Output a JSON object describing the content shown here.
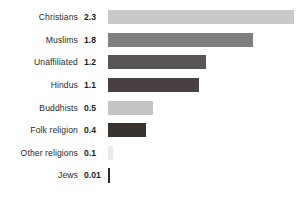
{
  "chart_data": {
    "type": "bar",
    "orientation": "horizontal",
    "title": "",
    "subtitle": "",
    "xlabel": "",
    "ylabel": "",
    "grid": false,
    "legend": "none",
    "axis_visible": false,
    "tick_labels": [],
    "xlim": [
      0,
      2.3
    ],
    "value_unit": "billions",
    "categories": [
      "Christians",
      "Muslims",
      "Unaffiliated",
      "Hindus",
      "Buddhists",
      "Folk religion",
      "Other religions",
      "Jews"
    ],
    "values": [
      2.3,
      1.8,
      1.2,
      1.1,
      0.5,
      0.4,
      0.1,
      0.01
    ],
    "value_labels": [
      "2.3",
      "1.8",
      "1.2",
      "1.1",
      "0.5",
      "0.4",
      "0.1",
      "0.01"
    ],
    "bar_colors": [
      "#c9c9c9",
      "#7e7e7e",
      "#585654",
      "#474241",
      "#c4c4c4",
      "#38332f",
      "#e9e9e9",
      "#2a2725"
    ]
  },
  "rows": [
    {
      "label": "Christians",
      "value_label": "2.3",
      "value": 2.3,
      "color": "#c9c9c9",
      "bar_px": 186
    },
    {
      "label": "Muslims",
      "value_label": "1.8",
      "value": 1.8,
      "color": "#7e7e7e",
      "bar_px": 145
    },
    {
      "label": "Unaffiliated",
      "value_label": "1.2",
      "value": 1.2,
      "color": "#585654",
      "bar_px": 98
    },
    {
      "label": "Hindus",
      "value_label": "1.1",
      "value": 1.1,
      "color": "#474241",
      "bar_px": 91
    },
    {
      "label": "Buddhists",
      "value_label": "0.5",
      "value": 0.5,
      "color": "#c4c4c4",
      "bar_px": 45
    },
    {
      "label": "Folk religion",
      "value_label": "0.4",
      "value": 0.4,
      "color": "#38332f",
      "bar_px": 38
    },
    {
      "label": "Other religions",
      "value_label": "0.1",
      "value": 0.1,
      "color": "#e9e9e9",
      "bar_px": 5
    },
    {
      "label": "Jews",
      "value_label": "0.01",
      "value": 0.01,
      "color": "#2a2725",
      "bar_px": 2
    }
  ]
}
